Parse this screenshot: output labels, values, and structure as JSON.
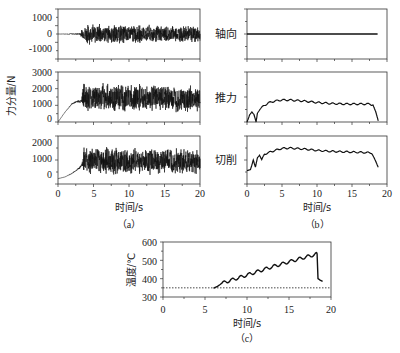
{
  "figure": {
    "panel_a_label": "（a）",
    "panel_b_label": "（b）",
    "panel_c_label": "（c）",
    "xlabel_a": "时间/s",
    "xlabel_b": "时间/s",
    "xlabel_c": "时间/s",
    "ylabel_a": "力分量/N",
    "ylabel_c": "温度/℃",
    "label_axial": "轴向",
    "label_thrust": "推力",
    "label_cutting": "切削",
    "line_color": "#111111",
    "axis_color": "#333333"
  },
  "chart_data": [
    {
      "panel": "a-1",
      "type": "line",
      "title": "",
      "xlabel": "",
      "ylabel": "",
      "xlim": [
        0,
        20
      ],
      "ylim": [
        -1500,
        1500
      ],
      "yticks": [
        -1000,
        0,
        1000
      ],
      "series": [
        {
          "name": "Axial force (raw)",
          "x": [
            0,
            3,
            3.5,
            4,
            20
          ],
          "center": [
            0,
            0,
            0,
            0,
            0
          ],
          "amplitude": [
            0,
            30,
            300,
            500,
            400
          ]
        }
      ]
    },
    {
      "panel": "a-2",
      "type": "line",
      "xlim": [
        0,
        20
      ],
      "ylim": [
        0,
        3000
      ],
      "yticks": [
        0,
        1000,
        2000,
        3000
      ],
      "series": [
        {
          "name": "Thrust force (raw)",
          "x": [
            0,
            1,
            2,
            2.8,
            3.3,
            3.5,
            20
          ],
          "center": [
            0,
            600,
            1100,
            1250,
            1250,
            1500,
            1400
          ],
          "amplitude": [
            0,
            0,
            30,
            60,
            100,
            700,
            650
          ]
        }
      ]
    },
    {
      "panel": "a-3",
      "type": "line",
      "xlim": [
        0,
        20
      ],
      "ylim": [
        -300,
        2400
      ],
      "yticks": [
        0,
        1000,
        2000
      ],
      "series": [
        {
          "name": "Cutting force (raw)",
          "x": [
            0,
            1,
            2,
            3,
            3.4,
            3.6,
            20
          ],
          "center": [
            0,
            100,
            300,
            600,
            800,
            1000,
            950
          ],
          "amplitude": [
            0,
            0,
            20,
            40,
            80,
            650,
            600
          ]
        }
      ]
    },
    {
      "panel": "b-1",
      "type": "line",
      "label": "轴向",
      "xlim": [
        0,
        20
      ],
      "series": [
        {
          "name": "Axial (filtered)",
          "x": [
            0,
            18.7
          ],
          "y_rel": [
            0.5,
            0.5
          ]
        }
      ]
    },
    {
      "panel": "b-2",
      "type": "line",
      "label": "推力",
      "xlim": [
        0,
        20
      ],
      "series": [
        {
          "name": "Thrust (filtered)",
          "x": [
            0,
            0.4,
            0.7,
            1.0,
            1.3,
            1.5,
            2,
            3,
            4,
            5,
            6,
            8,
            10,
            12,
            14,
            16,
            17.5,
            18,
            18.4,
            18.8
          ],
          "y_rel": [
            0.0,
            0.15,
            0.2,
            0.15,
            0.0,
            0.18,
            0.28,
            0.38,
            0.42,
            0.44,
            0.44,
            0.42,
            0.39,
            0.37,
            0.36,
            0.36,
            0.36,
            0.34,
            0.2,
            0.0
          ]
        }
      ]
    },
    {
      "panel": "b-3",
      "type": "line",
      "label": "切削",
      "xlim": [
        0,
        20
      ],
      "series": [
        {
          "name": "Cutting (filtered)",
          "x": [
            0,
            0.5,
            0.9,
            1.2,
            1.5,
            1.8,
            2.1,
            2.5,
            3,
            4,
            5,
            6,
            8,
            10,
            12,
            14,
            16,
            17.8,
            18.3,
            18.8
          ],
          "y_rel": [
            0.28,
            0.3,
            0.5,
            0.35,
            0.55,
            0.6,
            0.5,
            0.62,
            0.65,
            0.7,
            0.74,
            0.75,
            0.73,
            0.7,
            0.68,
            0.67,
            0.66,
            0.65,
            0.5,
            0.33
          ]
        }
      ]
    },
    {
      "panel": "c",
      "type": "line",
      "title": "",
      "xlabel": "时间/s",
      "ylabel": "温度/℃",
      "xlim": [
        0,
        20
      ],
      "ylim": [
        300,
        600
      ],
      "xticks": [
        0,
        5,
        10,
        15,
        20
      ],
      "yticks": [
        300,
        400,
        500,
        600
      ],
      "reference_line": {
        "y": 350,
        "style": "dotted"
      },
      "series": [
        {
          "name": "Temperature",
          "x": [
            6.0,
            6.5,
            7,
            8,
            9,
            10,
            11,
            12,
            13,
            14,
            15,
            16,
            17,
            18,
            18.3,
            18.4,
            18.6,
            19
          ],
          "y": [
            348,
            358,
            375,
            390,
            405,
            420,
            435,
            450,
            465,
            478,
            492,
            505,
            518,
            530,
            535,
            400,
            390,
            385
          ]
        }
      ]
    }
  ],
  "axes_text": {
    "a1_yticks": [
      "1000",
      "0",
      "-1000"
    ],
    "a2_yticks": [
      "3000",
      "2000",
      "1000",
      "0"
    ],
    "a3_yticks": [
      "2000",
      "1000",
      "0"
    ],
    "a_xticks": [
      "0",
      "5",
      "10",
      "15",
      "20"
    ],
    "b_xticks": [
      "0",
      "5",
      "10",
      "15",
      "20"
    ],
    "c_xticks": [
      "0",
      "5",
      "10",
      "15",
      "20"
    ],
    "c_yticks": [
      "600",
      "500",
      "400",
      "300"
    ]
  }
}
